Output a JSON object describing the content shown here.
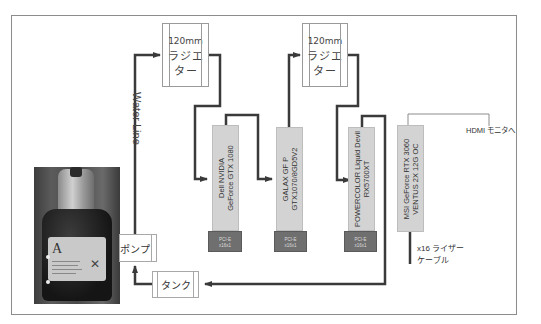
{
  "diagram": {
    "radiators": [
      {
        "size": "120mm",
        "name_line1": "ラジエ",
        "name_line2": "ター"
      },
      {
        "size": "120mm",
        "name_line1": "ラジエ",
        "name_line2": "ター"
      }
    ],
    "gpus": [
      {
        "line1": "Dell NVIDIA",
        "line2": "GeForce GTX 1080",
        "slot_line1": "PCI-E",
        "slot_line2": "x16x1"
      },
      {
        "line1": "GALAX GF P",
        "line2": "GTX1070/8GD5V2",
        "slot_line1": "PCI-E",
        "slot_line2": "x16x1"
      },
      {
        "line1": "POWERCOLOR Liquid Devil",
        "line2": "RX5700XT",
        "slot_line1": "PCI-E",
        "slot_line2": "x16x1"
      },
      {
        "line1": "MSI GeForce RTX 3060",
        "line2": "VENTUS 2X 12G OC"
      }
    ],
    "pump_label": "ポンプ",
    "tank_label": "タンク",
    "water_line_label": "Water Line",
    "hdmi_label": "HDMI モニタへ",
    "riser_line1": "x16 ライザー",
    "riser_line2": "ケーブル",
    "colors": {
      "pipe": "#3a3a3a",
      "gpu_fill": "#d3d3d3",
      "slot_fill": "#6f6f6f",
      "border": "#8c8c8c"
    }
  }
}
